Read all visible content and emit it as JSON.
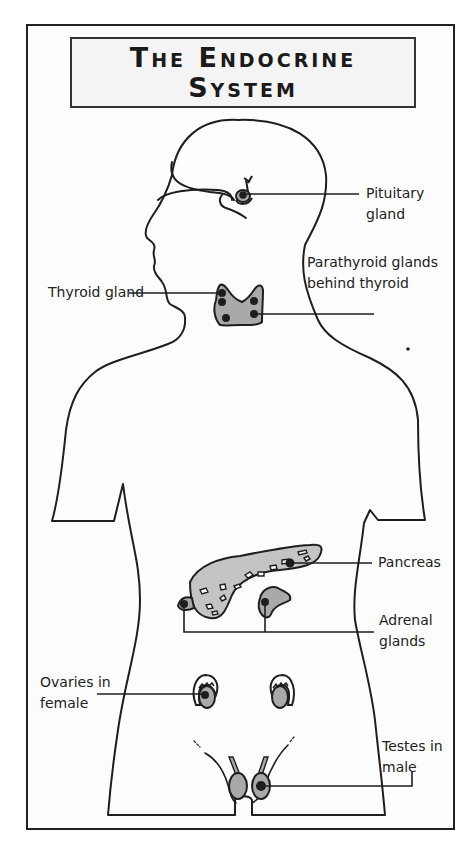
{
  "title": {
    "line1": "The Endocrine",
    "line2": "System"
  },
  "labels": {
    "pituitary": {
      "line1": "Pituitary",
      "line2": "gland"
    },
    "parathyroid": {
      "line1": "Parathyroid glands",
      "line2": "behind thyroid"
    },
    "thyroid": {
      "line1": "Thyroid gland"
    },
    "pancreas": {
      "line1": "Pancreas"
    },
    "adrenal": {
      "line1": "Adrenal",
      "line2": "glands"
    },
    "ovaries": {
      "line1": "Ovaries in",
      "line2": "female"
    },
    "testes": {
      "line1": "Testes in",
      "line2": "male"
    }
  },
  "colors": {
    "outline": "#1e1e1e",
    "gland_fill": "#a9a9a9",
    "pancreas_fill": "#c4c4c4",
    "background": "#fdfdfd"
  }
}
